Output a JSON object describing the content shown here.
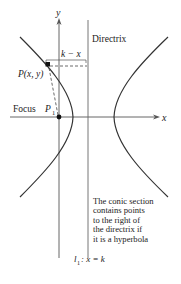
{
  "diagram": {
    "axes": {
      "x_label": "x",
      "y_label": "y"
    },
    "directrix_label": "Directrix",
    "distance_label": "k − x",
    "point_label": "P(x, y)",
    "focus_label": "Focus",
    "focus_point_label": "P",
    "focus_point_subscript": "1",
    "line_label": "l",
    "line_subscript": "1",
    "line_equation": ": x = k",
    "note_lines": [
      "The conic section",
      "contains points",
      "to the right of",
      "the directrix if",
      "it is a hyperbola"
    ],
    "colors": {
      "curve": "#333333",
      "axis": "#555555",
      "dashed": "#444444",
      "point": "#111111"
    }
  }
}
